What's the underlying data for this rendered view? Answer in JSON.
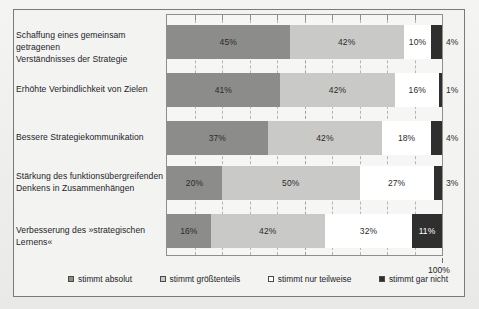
{
  "chart_data": {
    "type": "bar",
    "orientation": "horizontal",
    "stacked": true,
    "stacked_mode": "percent",
    "title": "",
    "xlabel": "",
    "ylabel": "",
    "xlim": [
      0,
      100
    ],
    "grid": true,
    "gridline_interval": 10,
    "axis_end_label": "100%",
    "legend_position": "bottom",
    "value_suffix": "%",
    "categories": [
      "Schaffung eines gemeinsam getragenen Verständnisses der Strategie",
      "Erhöhte Verbindlichkeit von Zielen",
      "Bessere Strategiekommunikation",
      "Stärkung des funktionsübergreifenden Denkens in Zusammenhängen",
      "Verbesserung des »strategischen Lernens«"
    ],
    "category_lines": [
      [
        "Schaffung eines gemeinsam getragenen",
        "Verständnisses der Strategie"
      ],
      [
        "Erhöhte Verbindlichkeit von Zielen"
      ],
      [
        "Bessere Strategiekommunikation"
      ],
      [
        "Stärkung des funktionsübergreifenden",
        "Denkens in Zusammenhängen"
      ],
      [
        "Verbesserung des »strategischen Lernens«"
      ]
    ],
    "series": [
      {
        "name": "stimmt absolut",
        "color": "#8c8c8a",
        "values": [
          45,
          41,
          37,
          20,
          16
        ]
      },
      {
        "name": "stimmt größtenteils",
        "color": "#c9c9c7",
        "values": [
          42,
          42,
          42,
          50,
          42
        ]
      },
      {
        "name": "stimmt nur teilweise",
        "color": "#ffffff",
        "values": [
          10,
          16,
          18,
          27,
          32
        ]
      },
      {
        "name": "stimmt gar nicht",
        "color": "#2f2f2f",
        "values": [
          4,
          1,
          4,
          3,
          11
        ]
      }
    ],
    "data_labels": [
      [
        "45%",
        "42%",
        "10%",
        "4%"
      ],
      [
        "41%",
        "42%",
        "16%",
        "1%"
      ],
      [
        "37%",
        "42%",
        "18%",
        "4%"
      ],
      [
        "20%",
        "50%",
        "27%",
        "3%"
      ],
      [
        "16%",
        "42%",
        "32%",
        "11%"
      ]
    ],
    "label_placement": [
      [
        "inside",
        "inside",
        "inside",
        "outside"
      ],
      [
        "inside",
        "inside",
        "inside",
        "outside"
      ],
      [
        "inside",
        "inside",
        "inside",
        "outside"
      ],
      [
        "inside",
        "inside",
        "inside",
        "outside"
      ],
      [
        "inside",
        "inside",
        "inside",
        "inside"
      ]
    ]
  },
  "legend": {
    "items": [
      {
        "label": "stimmt absolut"
      },
      {
        "label": "stimmt größtenteils"
      },
      {
        "label": "stimmt nur teilweise"
      },
      {
        "label": "stimmt gar nicht"
      }
    ]
  }
}
